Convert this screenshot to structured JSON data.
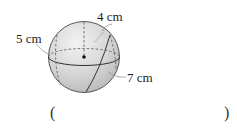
{
  "diagram": {
    "shape": "sphere",
    "labels": {
      "top": "4 cm",
      "left": "5 cm",
      "right": "7 cm"
    },
    "colors": {
      "fill_light": "#e6e6e6",
      "fill_dark": "#c4c4c4",
      "stroke": "#444444"
    }
  },
  "answer": {
    "open_paren": "(",
    "close_paren": ")",
    "value": ""
  }
}
